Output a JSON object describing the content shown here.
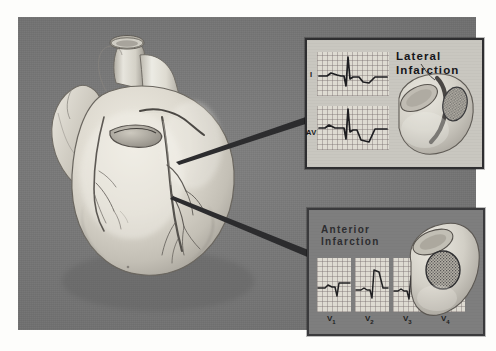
{
  "figure": {
    "name": "myocardial-infarction-localization-figure",
    "background_color": "#fdfdfb",
    "plate_color": "#787878",
    "medium": "grayscale airbrush medical illustration"
  },
  "heart": {
    "label": "anterior view of heart with coronary arteries",
    "structures": [
      "aorta",
      "pulmonary artery",
      "left atrial appendage",
      "right ventricle",
      "left ventricle",
      "left anterior descending artery",
      "circumflex artery",
      "diagonal branches"
    ]
  },
  "pointers": [
    {
      "name": "pointer-to-lateral-inset",
      "from": "circumflex artery / lateral wall",
      "to": "lateral-infarction-inset"
    },
    {
      "name": "pointer-to-anterior-inset",
      "from": "left anterior descending artery",
      "to": "anterior-infarction-inset"
    }
  ],
  "insets": [
    {
      "id": "lateral",
      "title": "Lateral\nInfarction",
      "panel_background": "#c9c7c0",
      "border_color": "#2e2e30",
      "leads": [
        {
          "label": "I",
          "name": "ecg-strip-lead-I",
          "morphology": "pathologic Q wave, tall R, inverted T"
        },
        {
          "label": "AVL",
          "name": "ecg-strip-lead-AVL",
          "morphology": "pathologic Q wave, tall R, deep inverted T"
        }
      ],
      "ventricle_diagram": {
        "name": "ventricle-lateral-infarct-diagram",
        "infarct_region": "lateral wall",
        "infarct_fill": "stippled / hatched"
      }
    },
    {
      "id": "anterior",
      "title": "Anterior\nInfarction",
      "panel_background": "#7e7e7e",
      "border_color": "#3a3a3c",
      "leads": [
        {
          "label": "V",
          "sub": "1",
          "name": "ecg-strip-lead-V1",
          "morphology": "QS complex with ST elevation"
        },
        {
          "label": "V",
          "sub": "2",
          "name": "ecg-strip-lead-V2",
          "morphology": "QS complex with marked ST elevation"
        },
        {
          "label": "V",
          "sub": "3",
          "name": "ecg-strip-lead-V3",
          "morphology": "Q wave with ST elevation"
        },
        {
          "label": "V",
          "sub": "4",
          "name": "ecg-strip-lead-V4",
          "morphology": "Q wave with ST elevation, reduced R"
        }
      ],
      "ventricle_diagram": {
        "name": "ventricle-anterior-infarct-diagram",
        "infarct_region": "anterior wall",
        "infarct_fill": "stippled circular patch"
      }
    }
  ]
}
